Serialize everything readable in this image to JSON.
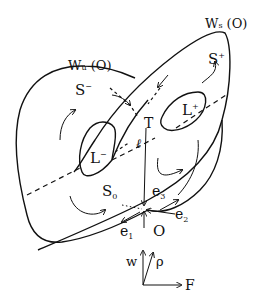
{
  "figure": {
    "type": "phase-space manifold diagram",
    "labels": {
      "unstable_manifold": {
        "main": "W",
        "sub": "u",
        "tail": " (O)"
      },
      "stable_manifold": {
        "main": "W",
        "sub": "s",
        "tail": " (O)"
      },
      "region_minus": {
        "main": "S",
        "sup": "−"
      },
      "region_plus": {
        "main": "S",
        "sup": "+"
      },
      "region_zero": {
        "main": "S",
        "sub": "0"
      },
      "curve_minus": {
        "main": "L",
        "sup": "−"
      },
      "curve_plus": {
        "main": "L",
        "sup": "+"
      },
      "point_T": "T",
      "line_ell": "ℓ",
      "fixed_point": "O",
      "eigen_1": {
        "main": "e",
        "sub": "1"
      },
      "eigen_2": {
        "main": "e",
        "sub": "2"
      },
      "eigen_3": {
        "main": "e",
        "sub": "3"
      }
    },
    "axes": {
      "vertical": "w",
      "oblique": "ρ",
      "horizontal": "F"
    }
  }
}
